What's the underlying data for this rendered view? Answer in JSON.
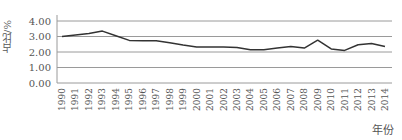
{
  "chart_data": {
    "type": "line",
    "title": "",
    "xlabel": "年份",
    "ylabel": "占比/%",
    "ylim": [
      0,
      4
    ],
    "yticks": [
      "0.00",
      "1.00",
      "2.00",
      "3.00",
      "4.00"
    ],
    "grid": true,
    "legend": null,
    "categories": [
      "1990",
      "1991",
      "1992",
      "1993",
      "1994",
      "1995",
      "1996",
      "1997",
      "1998",
      "1999",
      "2000",
      "2001",
      "2002",
      "2003",
      "2004",
      "2005",
      "2006",
      "2007",
      "2008",
      "2009",
      "2010",
      "2011",
      "2012",
      "2013",
      "2014"
    ],
    "series": [
      {
        "name": "占比",
        "values": [
          3.0,
          3.1,
          3.2,
          3.35,
          3.05,
          2.75,
          2.72,
          2.72,
          2.6,
          2.45,
          2.32,
          2.32,
          2.32,
          2.3,
          2.15,
          2.15,
          2.25,
          2.35,
          2.25,
          2.76,
          2.2,
          2.1,
          2.47,
          2.55,
          2.35
        ],
        "color": "#333333"
      }
    ]
  }
}
